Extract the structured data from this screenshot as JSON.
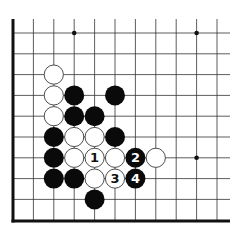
{
  "diagram": {
    "type": "go-board-fragment",
    "edges": [
      "left",
      "bottom"
    ],
    "columns": 11,
    "rows": 10,
    "star_points": [
      {
        "col": 3,
        "row": 0
      },
      {
        "col": 9,
        "row": 0
      },
      {
        "col": 9,
        "row": 6
      }
    ],
    "stones": [
      {
        "color": "white",
        "col": 2,
        "row": 2,
        "label": ""
      },
      {
        "color": "white",
        "col": 2,
        "row": 3,
        "label": ""
      },
      {
        "color": "black",
        "col": 3,
        "row": 3,
        "label": ""
      },
      {
        "color": "black",
        "col": 5,
        "row": 3,
        "label": ""
      },
      {
        "color": "white",
        "col": 2,
        "row": 4,
        "label": ""
      },
      {
        "color": "black",
        "col": 3,
        "row": 4,
        "label": ""
      },
      {
        "color": "black",
        "col": 4,
        "row": 4,
        "label": ""
      },
      {
        "color": "black",
        "col": 2,
        "row": 5,
        "label": ""
      },
      {
        "color": "white",
        "col": 3,
        "row": 5,
        "label": ""
      },
      {
        "color": "white",
        "col": 4,
        "row": 5,
        "label": ""
      },
      {
        "color": "black",
        "col": 5,
        "row": 5,
        "label": ""
      },
      {
        "color": "black",
        "col": 2,
        "row": 6,
        "label": ""
      },
      {
        "color": "white",
        "col": 3,
        "row": 6,
        "label": ""
      },
      {
        "color": "white",
        "col": 4,
        "row": 6,
        "label": "1"
      },
      {
        "color": "white",
        "col": 5,
        "row": 6,
        "label": ""
      },
      {
        "color": "black",
        "col": 6,
        "row": 6,
        "label": "2"
      },
      {
        "color": "white",
        "col": 7,
        "row": 6,
        "label": ""
      },
      {
        "color": "black",
        "col": 2,
        "row": 7,
        "label": ""
      },
      {
        "color": "black",
        "col": 3,
        "row": 7,
        "label": ""
      },
      {
        "color": "white",
        "col": 4,
        "row": 7,
        "label": ""
      },
      {
        "color": "white",
        "col": 5,
        "row": 7,
        "label": "3"
      },
      {
        "color": "black",
        "col": 6,
        "row": 7,
        "label": "4"
      },
      {
        "color": "black",
        "col": 4,
        "row": 8,
        "label": ""
      }
    ],
    "colors": {
      "line": "#333333",
      "edge": "#111111",
      "black_stone": "#0a0a0a",
      "white_stone": "#ffffff",
      "background": "#ffffff"
    }
  }
}
